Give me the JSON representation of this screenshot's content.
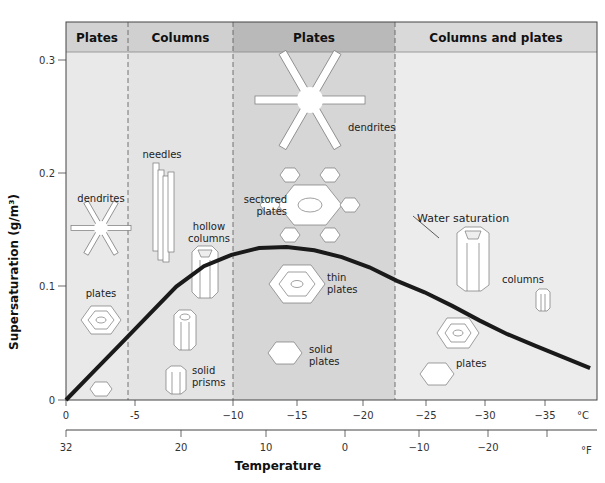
{
  "diagram": {
    "title_regions": [
      {
        "label": "Plates",
        "x0": 66,
        "x1": 128,
        "fill": "#e9e9e9",
        "header_fill": "#d2d2d2"
      },
      {
        "label": "Columns",
        "x0": 128,
        "x1": 233,
        "fill": "#e4e4e4",
        "header_fill": "#d0d0d0"
      },
      {
        "label": "Plates",
        "x0": 233,
        "x1": 395,
        "fill": "#d6d6d6",
        "header_fill": "#b9b9b9"
      },
      {
        "label": "Columns and plates",
        "x0": 395,
        "x1": 597,
        "fill": "#ececec",
        "header_fill": "#d9d9d9"
      }
    ],
    "y_axis": {
      "label": "Supersaturation (g/m³)",
      "ticks": [
        {
          "label": "0",
          "y": 400
        },
        {
          "label": "0.1",
          "y": 286
        },
        {
          "label": "0.2",
          "y": 173
        },
        {
          "label": "0.3",
          "y": 60
        }
      ]
    },
    "x_axis_c": {
      "unit": "°C",
      "ticks": [
        {
          "label": "0",
          "x": 66
        },
        {
          "label": "-5",
          "x": 135
        },
        {
          "label": "−10",
          "x": 233
        },
        {
          "label": "−15",
          "x": 297
        },
        {
          "label": "−20",
          "x": 363
        },
        {
          "label": "−25",
          "x": 426
        },
        {
          "label": "−30",
          "x": 485
        },
        {
          "label": "−35",
          "x": 545
        }
      ]
    },
    "x_axis_f": {
      "unit": "°F",
      "ticks": [
        {
          "label": "32",
          "x": 66
        },
        {
          "label": "20",
          "x": 181
        },
        {
          "label": "10",
          "x": 266
        },
        {
          "label": "0",
          "x": 345
        },
        {
          "label": "−10",
          "x": 419
        },
        {
          "label": "−20",
          "x": 488
        }
      ]
    },
    "x_axis_title": "Temperature",
    "curve_label": "Water saturation",
    "crystal_labels": {
      "dendrites_left": "dendrites",
      "plates_left": "plates",
      "needles": "needles",
      "hollow_columns_1": "hollow",
      "hollow_columns_2": "columns",
      "solid_prisms_1": "solid",
      "solid_prisms_2": "prisms",
      "dendrites_mid": "dendrites",
      "sectored_1": "sectored",
      "sectored_2": "plates",
      "thin_1": "thin",
      "thin_2": "plates",
      "solid_plates_1": "solid",
      "solid_plates_2": "plates",
      "columns_right": "columns",
      "plates_right": "plates"
    }
  },
  "chart_data": {
    "type": "line",
    "title": "",
    "xlabel": "Temperature (°C)",
    "ylabel": "Supersaturation (g/m³)",
    "ylim": [
      0,
      0.31
    ],
    "xlim": [
      0,
      -38
    ],
    "series": [
      {
        "name": "Water saturation",
        "x": [
          0,
          -2,
          -4,
          -6,
          -8,
          -10,
          -12,
          -14,
          -16,
          -18,
          -20,
          -22,
          -24,
          -26,
          -28,
          -30,
          -32,
          -34,
          -36,
          -38
        ],
        "values": [
          0,
          0.025,
          0.05,
          0.075,
          0.1,
          0.118,
          0.128,
          0.134,
          0.135,
          0.132,
          0.126,
          0.117,
          0.105,
          0.095,
          0.083,
          0.07,
          0.058,
          0.048,
          0.038,
          0.028
        ]
      }
    ],
    "regions": [
      {
        "label": "Plates",
        "from_c": 0,
        "to_c": -4
      },
      {
        "label": "Columns",
        "from_c": -4,
        "to_c": -10
      },
      {
        "label": "Plates",
        "from_c": -10,
        "to_c": -22
      },
      {
        "label": "Columns and plates",
        "from_c": -22,
        "to_c": -40
      }
    ]
  }
}
